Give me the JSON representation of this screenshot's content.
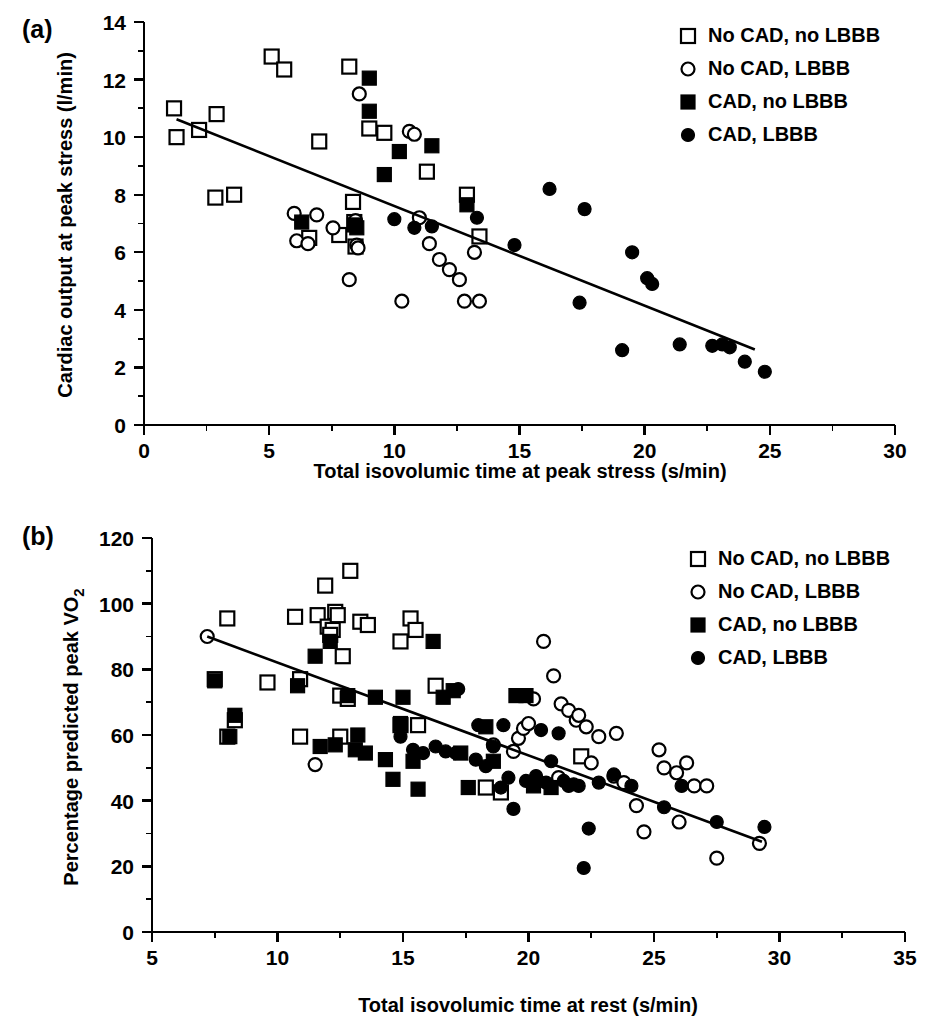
{
  "figure": {
    "panel_a_tag": "(a)",
    "panel_b_tag": "(b)"
  },
  "legend": {
    "items": [
      {
        "label": "No CAD, no LBBB",
        "marker": "open-square"
      },
      {
        "label": "No CAD, LBBB",
        "marker": "open-circle"
      },
      {
        "label": "CAD, no LBBB",
        "marker": "filled-square"
      },
      {
        "label": "CAD, LBBB",
        "marker": "filled-circle"
      }
    ]
  },
  "chart_data": [
    {
      "type": "scatter",
      "panel": "(a)",
      "title": "",
      "xlabel": "Total isovolumic time at peak stress (s/min)",
      "ylabel": "Cardiac output at peak stress (l/min)",
      "xlim": [
        0,
        30
      ],
      "ylim": [
        0,
        14
      ],
      "xticks": [
        0,
        5,
        10,
        15,
        20,
        25,
        30
      ],
      "xtick_labels": [
        "0",
        "5",
        "10",
        "15",
        "20",
        "25",
        "30"
      ],
      "yticks": [
        0,
        2,
        4,
        6,
        8,
        10,
        12,
        14
      ],
      "ytick_labels": [
        "0",
        "2",
        "4",
        "6",
        "8",
        "10",
        "12",
        "14"
      ],
      "xminor_step": 2.5,
      "yminor_step": 1,
      "grid": false,
      "legend_position": "top-right",
      "fit_line": {
        "x0": 1.3,
        "y0": 10.62,
        "x1": 24.4,
        "y1": 2.62
      },
      "series": [
        {
          "name": "No CAD, no LBBB",
          "marker": "open-square",
          "points": [
            [
              1.2,
              11.0
            ],
            [
              1.3,
              10.0
            ],
            [
              2.2,
              10.25
            ],
            [
              2.85,
              7.9
            ],
            [
              2.9,
              10.8
            ],
            [
              3.6,
              8.0
            ],
            [
              5.1,
              12.8
            ],
            [
              5.6,
              12.35
            ],
            [
              6.6,
              6.5
            ],
            [
              7.0,
              9.85
            ],
            [
              7.8,
              6.6
            ],
            [
              8.2,
              12.45
            ],
            [
              8.35,
              7.75
            ],
            [
              8.4,
              7.05
            ],
            [
              8.45,
              6.2
            ],
            [
              9.0,
              10.3
            ],
            [
              9.6,
              10.15
            ],
            [
              11.3,
              8.8
            ],
            [
              12.9,
              8.0
            ],
            [
              13.4,
              6.55
            ]
          ]
        },
        {
          "name": "No CAD, LBBB",
          "marker": "open-circle",
          "points": [
            [
              6.0,
              7.35
            ],
            [
              6.1,
              6.4
            ],
            [
              6.55,
              6.3
            ],
            [
              6.9,
              7.3
            ],
            [
              7.55,
              6.85
            ],
            [
              8.2,
              5.05
            ],
            [
              8.45,
              7.1
            ],
            [
              8.5,
              6.25
            ],
            [
              8.55,
              6.15
            ],
            [
              8.6,
              11.5
            ],
            [
              10.3,
              4.3
            ],
            [
              10.6,
              10.2
            ],
            [
              10.8,
              10.1
            ],
            [
              11.0,
              7.2
            ],
            [
              11.4,
              6.3
            ],
            [
              11.8,
              5.75
            ],
            [
              12.6,
              5.05
            ],
            [
              12.8,
              4.3
            ],
            [
              13.2,
              6.0
            ],
            [
              13.4,
              4.3
            ],
            [
              12.2,
              5.4
            ]
          ]
        },
        {
          "name": "CAD, no LBBB",
          "marker": "filled-square",
          "points": [
            [
              6.3,
              7.05
            ],
            [
              8.4,
              6.95
            ],
            [
              8.5,
              6.85
            ],
            [
              9.0,
              12.05
            ],
            [
              9.0,
              10.9
            ],
            [
              9.6,
              8.7
            ],
            [
              10.2,
              9.5
            ],
            [
              11.5,
              9.7
            ],
            [
              12.9,
              7.65
            ]
          ]
        },
        {
          "name": "CAD, LBBB",
          "marker": "filled-circle",
          "points": [
            [
              10.0,
              7.15
            ],
            [
              10.8,
              6.85
            ],
            [
              11.5,
              6.9
            ],
            [
              13.3,
              7.2
            ],
            [
              16.2,
              8.2
            ],
            [
              17.6,
              7.5
            ],
            [
              14.8,
              6.25
            ],
            [
              17.4,
              4.25
            ],
            [
              19.1,
              2.6
            ],
            [
              19.5,
              6.0
            ],
            [
              20.1,
              5.1
            ],
            [
              20.3,
              4.9
            ],
            [
              21.4,
              2.8
            ],
            [
              22.7,
              2.75
            ],
            [
              23.1,
              2.8
            ],
            [
              23.4,
              2.7
            ],
            [
              24.0,
              2.2
            ],
            [
              24.8,
              1.85
            ]
          ]
        }
      ]
    },
    {
      "type": "scatter",
      "panel": "(b)",
      "title": "",
      "xlabel": "Total isovolumic time at rest (s/min)",
      "ylabel": "Percentage predicted peak VO2",
      "ylabel_sub": "2",
      "xlim": [
        5,
        35
      ],
      "ylim": [
        0,
        120
      ],
      "xticks": [
        5,
        10,
        15,
        20,
        25,
        30,
        35
      ],
      "xtick_labels": [
        "5",
        "10",
        "15",
        "20",
        "25",
        "30",
        "35"
      ],
      "yticks": [
        0,
        20,
        40,
        60,
        80,
        100,
        120
      ],
      "ytick_labels": [
        "0",
        "20",
        "40",
        "60",
        "80",
        "100",
        "120"
      ],
      "xminor_step": 2.5,
      "yminor_step": 10,
      "grid": false,
      "legend_position": "top-right",
      "fit_line": {
        "x0": 7.2,
        "y0": 90.0,
        "x1": 29.3,
        "y1": 27.5
      },
      "series": [
        {
          "name": "No CAD, no LBBB",
          "marker": "open-square",
          "points": [
            [
              7.5,
              77.0
            ],
            [
              8.0,
              95.5
            ],
            [
              8.3,
              64.5
            ],
            [
              8.0,
              59.5
            ],
            [
              9.6,
              76.0
            ],
            [
              10.7,
              96.0
            ],
            [
              10.9,
              77.0
            ],
            [
              10.9,
              59.5
            ],
            [
              11.6,
              96.5
            ],
            [
              11.9,
              105.5
            ],
            [
              12.0,
              93.0
            ],
            [
              12.2,
              92.0
            ],
            [
              12.1,
              90.5
            ],
            [
              12.3,
              97.5
            ],
            [
              12.4,
              96.5
            ],
            [
              12.6,
              84.0
            ],
            [
              12.5,
              72.0
            ],
            [
              12.8,
              71.0
            ],
            [
              12.5,
              59.5
            ],
            [
              12.9,
              110.0
            ],
            [
              13.3,
              94.5
            ],
            [
              13.6,
              93.5
            ],
            [
              14.9,
              63.0
            ],
            [
              15.6,
              63.0
            ],
            [
              14.9,
              88.5
            ],
            [
              15.3,
              95.5
            ],
            [
              15.5,
              92.0
            ],
            [
              16.3,
              75.0
            ],
            [
              18.3,
              44.0
            ],
            [
              18.9,
              42.5
            ],
            [
              22.1,
              53.5
            ]
          ]
        },
        {
          "name": "No CAD, LBBB",
          "marker": "open-circle",
          "points": [
            [
              7.2,
              90.0
            ],
            [
              11.5,
              51.0
            ],
            [
              19.4,
              55.0
            ],
            [
              19.6,
              59.0
            ],
            [
              19.8,
              62.0
            ],
            [
              20.0,
              63.5
            ],
            [
              20.2,
              71.0
            ],
            [
              20.6,
              88.5
            ],
            [
              21.0,
              78.0
            ],
            [
              21.3,
              69.5
            ],
            [
              21.6,
              67.5
            ],
            [
              21.9,
              64.5
            ],
            [
              22.0,
              66.0
            ],
            [
              22.3,
              62.5
            ],
            [
              22.5,
              51.5
            ],
            [
              22.8,
              59.5
            ],
            [
              23.4,
              47.5
            ],
            [
              23.8,
              45.5
            ],
            [
              24.3,
              38.5
            ],
            [
              24.6,
              30.5
            ],
            [
              25.2,
              55.5
            ],
            [
              25.4,
              50.0
            ],
            [
              25.9,
              48.5
            ],
            [
              26.3,
              51.5
            ],
            [
              26.6,
              44.5
            ],
            [
              27.1,
              44.5
            ],
            [
              26.0,
              33.5
            ],
            [
              27.5,
              22.5
            ],
            [
              29.2,
              27.0
            ],
            [
              23.5,
              60.5
            ],
            [
              18.6,
              57.0
            ],
            [
              21.2,
              47.0
            ]
          ]
        },
        {
          "name": "CAD, no LBBB",
          "marker": "filled-square",
          "points": [
            [
              7.5,
              76.5
            ],
            [
              8.1,
              59.5
            ],
            [
              8.3,
              66.0
            ],
            [
              10.8,
              75.0
            ],
            [
              11.5,
              84.0
            ],
            [
              11.7,
              56.5
            ],
            [
              12.1,
              88.5
            ],
            [
              12.3,
              57.0
            ],
            [
              12.8,
              72.0
            ],
            [
              13.1,
              55.5
            ],
            [
              13.5,
              54.5
            ],
            [
              13.9,
              71.5
            ],
            [
              14.3,
              52.5
            ],
            [
              14.6,
              46.5
            ],
            [
              14.9,
              63.5
            ],
            [
              15.4,
              52.0
            ],
            [
              15.6,
              43.5
            ],
            [
              16.2,
              88.5
            ],
            [
              16.6,
              71.5
            ],
            [
              17.0,
              73.5
            ],
            [
              17.3,
              54.5
            ],
            [
              17.6,
              44.0
            ],
            [
              18.3,
              62.5
            ],
            [
              18.6,
              52.0
            ],
            [
              19.5,
              72.0
            ],
            [
              19.9,
              72.0
            ],
            [
              20.2,
              44.5
            ],
            [
              20.9,
              44.0
            ],
            [
              15.0,
              71.5
            ],
            [
              13.2,
              60.0
            ]
          ]
        },
        {
          "name": "CAD, LBBB",
          "marker": "filled-circle",
          "points": [
            [
              14.9,
              59.5
            ],
            [
              15.4,
              55.5
            ],
            [
              15.8,
              54.5
            ],
            [
              16.3,
              56.5
            ],
            [
              16.7,
              55.0
            ],
            [
              17.1,
              54.5
            ],
            [
              17.2,
              74.0
            ],
            [
              17.9,
              52.5
            ],
            [
              18.3,
              50.5
            ],
            [
              18.6,
              56.5
            ],
            [
              18.9,
              44.0
            ],
            [
              19.2,
              47.0
            ],
            [
              19.4,
              37.5
            ],
            [
              19.9,
              46.0
            ],
            [
              20.3,
              47.5
            ],
            [
              20.5,
              61.5
            ],
            [
              20.7,
              45.5
            ],
            [
              20.9,
              52.0
            ],
            [
              21.2,
              60.5
            ],
            [
              21.4,
              46.0
            ],
            [
              21.6,
              44.5
            ],
            [
              21.8,
              45.0
            ],
            [
              22.0,
              44.5
            ],
            [
              22.2,
              19.5
            ],
            [
              22.4,
              31.5
            ],
            [
              22.8,
              45.5
            ],
            [
              23.4,
              48.0
            ],
            [
              24.1,
              44.5
            ],
            [
              25.4,
              38.0
            ],
            [
              26.1,
              44.5
            ],
            [
              27.5,
              33.5
            ],
            [
              29.4,
              32.0
            ],
            [
              18.0,
              63.0
            ],
            [
              19.0,
              63.0
            ]
          ]
        }
      ]
    }
  ]
}
